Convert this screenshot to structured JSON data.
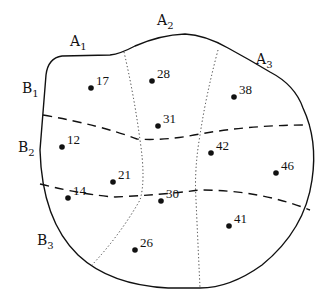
{
  "diagram": {
    "column_labels": [
      {
        "id": "A1",
        "main": "A",
        "sub": "1",
        "x": 70,
        "y": 46
      },
      {
        "id": "A2",
        "main": "A",
        "sub": "2",
        "x": 157,
        "y": 25
      },
      {
        "id": "A3",
        "main": "A",
        "sub": "3",
        "x": 256,
        "y": 64
      }
    ],
    "row_labels": [
      {
        "id": "B1",
        "main": "B",
        "sub": "1",
        "x": 22,
        "y": 93
      },
      {
        "id": "B2",
        "main": "B",
        "sub": "2",
        "x": 18,
        "y": 152
      },
      {
        "id": "B3",
        "main": "B",
        "sub": "3",
        "x": 37,
        "y": 245
      }
    ],
    "points": [
      {
        "label": "17",
        "x": 91,
        "y": 88
      },
      {
        "label": "28",
        "x": 152,
        "y": 81
      },
      {
        "label": "38",
        "x": 234,
        "y": 97
      },
      {
        "label": "31",
        "x": 158,
        "y": 126
      },
      {
        "label": "12",
        "x": 62,
        "y": 147
      },
      {
        "label": "42",
        "x": 211,
        "y": 153
      },
      {
        "label": "46",
        "x": 276,
        "y": 173
      },
      {
        "label": "21",
        "x": 113,
        "y": 182
      },
      {
        "label": "14",
        "x": 68,
        "y": 198
      },
      {
        "label": "30",
        "x": 161,
        "y": 201
      },
      {
        "label": "41",
        "x": 229,
        "y": 226
      },
      {
        "label": "26",
        "x": 135,
        "y": 250
      }
    ],
    "colors": {
      "line": "#111111",
      "background": "#ffffff"
    }
  }
}
